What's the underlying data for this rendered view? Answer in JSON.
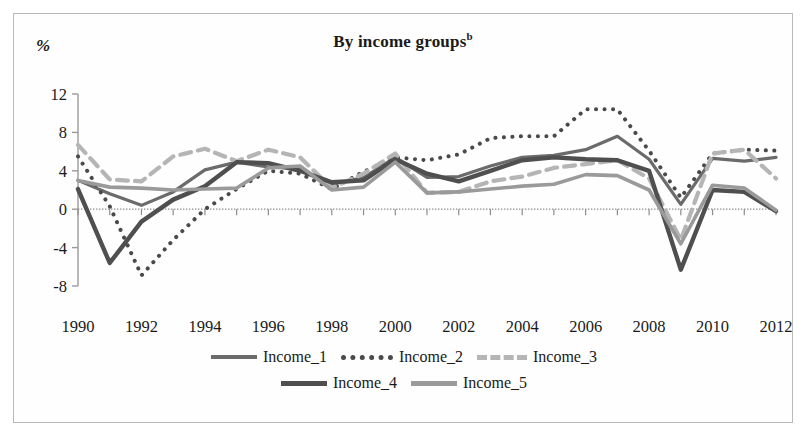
{
  "figure": {
    "title": "By income groups",
    "title_superscript": "b",
    "yaxis_unit": "%",
    "border_color": "#b9b9b9",
    "background": "#ffffff"
  },
  "legend": {
    "position": "bottom",
    "rows": [
      [
        {
          "label": "Income_1",
          "style": "solid",
          "color": "#6b6b6b",
          "swatch": "sw-solid-dark"
        },
        {
          "label": "Income_2",
          "style": "dotted",
          "color": "#4a4a4a",
          "swatch": "sw-dotted"
        },
        {
          "label": "Income_3",
          "style": "dashed",
          "color": "#b5b5b5",
          "swatch": "sw-dashed"
        }
      ],
      [
        {
          "label": "Income_4",
          "style": "solid",
          "color": "#4f4f4f",
          "swatch": "sw-thick"
        },
        {
          "label": "Income_5",
          "style": "solid",
          "color": "#9a9a9a",
          "swatch": "sw-gray"
        }
      ]
    ]
  },
  "chart_data": {
    "type": "line",
    "title": "By income groups",
    "xlabel": "",
    "ylabel": "%",
    "ylim": [
      -8,
      12
    ],
    "xlim": [
      1990,
      2012
    ],
    "yticks": [
      12,
      8,
      4,
      0,
      -4,
      -8
    ],
    "xticks": [
      1990,
      1992,
      1994,
      1996,
      1998,
      2000,
      2002,
      2004,
      2006,
      2008,
      2010,
      2012
    ],
    "xtick_labels": [
      "1990",
      "1992",
      "1994",
      "1996",
      "1998",
      "2000",
      "2002",
      "2004",
      "2006",
      "2008",
      "2010",
      "2012"
    ],
    "ytick_labels": [
      "12",
      "8",
      "4",
      "0",
      "-4",
      "-8"
    ],
    "grid": false,
    "zero_line": true,
    "x": [
      1990,
      1991,
      1992,
      1993,
      1994,
      1995,
      1996,
      1997,
      1998,
      1999,
      2000,
      2001,
      2002,
      2003,
      2004,
      2005,
      2006,
      2007,
      2008,
      2009,
      2010,
      2011,
      2012
    ],
    "series": [
      {
        "name": "Income_1",
        "style": "solid",
        "color": "#6b6b6b",
        "width": 3.2,
        "values": [
          3.0,
          1.6,
          0.4,
          1.8,
          4.1,
          4.9,
          4.4,
          4.2,
          2.6,
          3.3,
          5.4,
          3.3,
          3.4,
          4.5,
          5.4,
          5.6,
          6.2,
          7.6,
          5.2,
          0.5,
          5.3,
          5.0,
          5.4
        ]
      },
      {
        "name": "Income_2",
        "style": "dotted",
        "color": "#4a4a4a",
        "width": 4.0,
        "values": [
          5.5,
          0.3,
          -6.9,
          -3.2,
          0.0,
          2.1,
          4.0,
          3.7,
          2.1,
          3.9,
          5.4,
          5.1,
          5.7,
          7.4,
          7.6,
          7.6,
          10.4,
          10.4,
          6.1,
          1.2,
          5.8,
          6.2,
          6.1
        ]
      },
      {
        "name": "Income_3",
        "style": "dashed",
        "color": "#b5b5b5",
        "width": 4.2,
        "values": [
          6.7,
          3.1,
          2.9,
          5.5,
          6.3,
          5.0,
          6.2,
          5.4,
          2.2,
          3.7,
          5.8,
          1.7,
          1.8,
          2.9,
          3.4,
          4.3,
          4.7,
          5.1,
          3.2,
          -3.2,
          5.8,
          6.2,
          3.2
        ]
      },
      {
        "name": "Income_4",
        "style": "solid",
        "color": "#4f4f4f",
        "width": 4.4,
        "values": [
          2.1,
          -5.6,
          -1.3,
          1.0,
          2.4,
          4.9,
          4.8,
          4.0,
          2.8,
          3.0,
          5.2,
          3.7,
          2.9,
          4.0,
          5.1,
          5.4,
          5.2,
          5.1,
          4.0,
          -6.3,
          2.0,
          1.8,
          -0.2
        ]
      },
      {
        "name": "Income_5",
        "style": "solid",
        "color": "#9a9a9a",
        "width": 3.6,
        "values": [
          3.0,
          2.3,
          2.2,
          2.0,
          2.1,
          2.2,
          4.3,
          4.5,
          2.0,
          2.3,
          4.9,
          1.7,
          1.8,
          2.1,
          2.4,
          2.6,
          3.6,
          3.5,
          2.0,
          -3.6,
          2.5,
          2.2,
          -0.1
        ]
      }
    ]
  }
}
